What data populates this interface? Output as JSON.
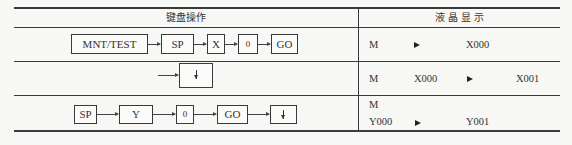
{
  "table": {
    "headers": {
      "keyboard_operation": "键盘操作",
      "lcd_display": "液 晶 显 示"
    },
    "rows": [
      {
        "keys": [
          "MNT/TEST",
          "SP",
          "X",
          "0",
          "GO"
        ],
        "lcd": {
          "line1": [
            "M",
            "▶",
            "X000"
          ]
        }
      },
      {
        "keys": [
          "↓"
        ],
        "lcd": {
          "line1": [
            "M",
            "X000",
            "▶",
            "X001"
          ]
        }
      },
      {
        "keys": [
          "SP",
          "Y",
          "0",
          "GO",
          "↓"
        ],
        "lcd": {
          "line1": [
            "M"
          ],
          "line2": [
            "Y000",
            "▶",
            "Y001"
          ]
        }
      }
    ]
  }
}
